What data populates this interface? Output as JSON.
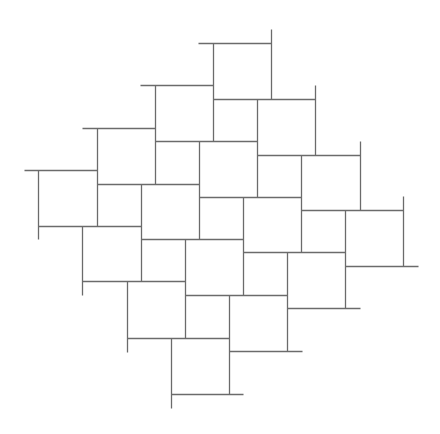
{
  "diagram": {
    "type": "pythagorean-tiling",
    "canvas": {
      "width": 440,
      "height": 434,
      "background": "#ffffff"
    },
    "stroke_color": "#6b6b6b",
    "large_square_size": [
      58,
      56
    ],
    "small_square_size": [
      44,
      42
    ],
    "horizontal_segments": [
      [
        198,
        43,
        271,
        43
      ],
      [
        140,
        85,
        213,
        85
      ],
      [
        213,
        99,
        315,
        99
      ],
      [
        82,
        128,
        155,
        128
      ],
      [
        155,
        141,
        257,
        141
      ],
      [
        257,
        155,
        360,
        155
      ],
      [
        24,
        170,
        97,
        170
      ],
      [
        97,
        184,
        199,
        184
      ],
      [
        199,
        197,
        301,
        197
      ],
      [
        301,
        210,
        403,
        210
      ],
      [
        38,
        226,
        141,
        226
      ],
      [
        141,
        239,
        243,
        239
      ],
      [
        243,
        252,
        345,
        252
      ],
      [
        345,
        266,
        418,
        266
      ],
      [
        82,
        281,
        185,
        281
      ],
      [
        185,
        295,
        287,
        295
      ],
      [
        287,
        308,
        360,
        308
      ],
      [
        127,
        338,
        229,
        338
      ],
      [
        229,
        351,
        302,
        351
      ],
      [
        171,
        394,
        243,
        394
      ]
    ],
    "vertical_segments": [
      [
        271,
        29,
        271,
        99
      ],
      [
        213,
        43,
        213,
        141
      ],
      [
        315,
        85,
        315,
        155
      ],
      [
        155,
        85,
        155,
        184
      ],
      [
        257,
        99,
        257,
        197
      ],
      [
        360,
        141,
        360,
        210
      ],
      [
        97,
        128,
        97,
        226
      ],
      [
        199,
        141,
        199,
        239
      ],
      [
        301,
        155,
        301,
        252
      ],
      [
        403,
        196,
        403,
        266
      ],
      [
        38,
        170,
        38,
        239
      ],
      [
        141,
        184,
        141,
        281
      ],
      [
        243,
        197,
        243,
        295
      ],
      [
        345,
        210,
        345,
        308
      ],
      [
        82,
        226,
        82,
        295
      ],
      [
        185,
        239,
        185,
        338
      ],
      [
        287,
        252,
        287,
        351
      ],
      [
        127,
        281,
        127,
        352
      ],
      [
        229,
        295,
        229,
        394
      ],
      [
        171,
        338,
        171,
        408
      ]
    ]
  }
}
